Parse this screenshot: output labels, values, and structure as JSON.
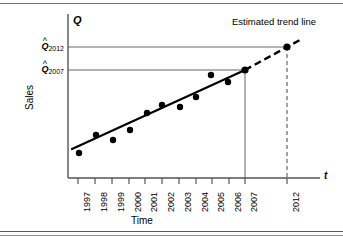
{
  "figure": {
    "y_axis_symbol": "Q",
    "x_axis_symbol": "t",
    "y_axis_title": "Sales",
    "x_axis_title": "Time",
    "annotation": "Estimated trend line",
    "q_labels": [
      {
        "name": "q2012",
        "base": "Q",
        "hat": "^",
        "subscript": "2012"
      },
      {
        "name": "q2007",
        "base": "Q",
        "hat": "^",
        "subscript": "2007"
      }
    ]
  },
  "colors": {
    "ink": "#000000",
    "rule": "#6e6e6e",
    "axis": "#555555",
    "guide": "#666666",
    "background": "#ffffff"
  },
  "chart_data": {
    "type": "scatter",
    "title": "",
    "subtitle": "",
    "xlabel": "Time",
    "ylabel": "Sales",
    "annotations": [
      "Estimated trend line"
    ],
    "legend": null,
    "grid": false,
    "x_symbol": "t",
    "y_symbol": "Q",
    "categories": [
      "1997",
      "1998",
      "1999",
      "2000",
      "2001",
      "2002",
      "2003",
      "2004",
      "2005",
      "2006",
      "2007",
      "2012"
    ],
    "tick_labels": [
      "1997",
      "1998",
      "1999",
      "2000",
      "2001",
      "2002",
      "2003",
      "2004",
      "2005",
      "2006",
      "2007",
      "2012"
    ],
    "xlim": [
      1996.5,
      2012.8
    ],
    "ylim": [
      0,
      100
    ],
    "observed_series": {
      "name": "Sales observations",
      "x": [
        1997,
        1998,
        1999,
        2000,
        2001,
        2002,
        2003,
        2004,
        2005,
        2006,
        2007
      ],
      "values": [
        22,
        41,
        34,
        45,
        56,
        62,
        60,
        69,
        79,
        73,
        86
      ]
    },
    "trend_line": {
      "name": "Estimated trend line",
      "style": "solid",
      "x": [
        1996.8,
        2007
      ],
      "values": [
        26,
        86
      ]
    },
    "forecast_line": {
      "name": "Extrapolated trend",
      "style": "dashed",
      "x": [
        2007,
        2012.5
      ],
      "values": [
        86,
        118
      ]
    },
    "forecast_points": [
      {
        "label": "Q2007",
        "x": 2007,
        "value": 86
      },
      {
        "label": "Q2012",
        "x": 2012,
        "value": 112
      }
    ],
    "reference_lines": [
      {
        "label": "Q2012",
        "y_value": 112,
        "x_from": 1996.5,
        "x_to": 2012
      },
      {
        "label": "Q2007",
        "y_value": 86,
        "x_from": 1996.5,
        "x_to": 2007
      }
    ],
    "drop_lines": [
      {
        "label": "2007",
        "x": 2007,
        "style": "solid"
      },
      {
        "label": "2012",
        "x": 2012,
        "style": "dashed"
      }
    ]
  }
}
